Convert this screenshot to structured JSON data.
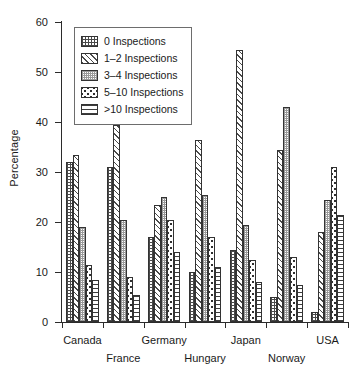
{
  "chart_data": {
    "type": "bar",
    "title": "",
    "subtitle": "",
    "xlabel": "",
    "ylabel": "Percentage",
    "ylim": [
      0,
      60
    ],
    "yticks": [
      0,
      10,
      20,
      30,
      40,
      50,
      60
    ],
    "grid": false,
    "legend_position": "upper-left",
    "categories": [
      "Canada",
      "France",
      "Germany",
      "Hungary",
      "Japan",
      "Norway",
      "USA"
    ],
    "series": [
      {
        "name": "0 Inspections",
        "pattern": "grid",
        "values": [
          32.0,
          31.0,
          17.0,
          10.0,
          14.5,
          5.0,
          2.0
        ]
      },
      {
        "name": "1–2 Inspections",
        "pattern": "diag",
        "values": [
          33.5,
          39.5,
          23.5,
          36.5,
          54.5,
          34.5,
          18.0
        ]
      },
      {
        "name": "3–4 Inspections",
        "pattern": "stipple",
        "values": [
          19.0,
          20.5,
          25.0,
          25.5,
          19.5,
          43.0,
          24.5
        ]
      },
      {
        "name": "5–10 Inspections",
        "pattern": "dots",
        "values": [
          11.5,
          9.0,
          20.5,
          17.0,
          12.5,
          13.0,
          31.0
        ]
      },
      {
        "name": ">10 Inspections",
        "pattern": "hlines",
        "values": [
          8.5,
          5.5,
          14.0,
          11.0,
          8.0,
          7.5,
          21.5
        ]
      }
    ]
  }
}
